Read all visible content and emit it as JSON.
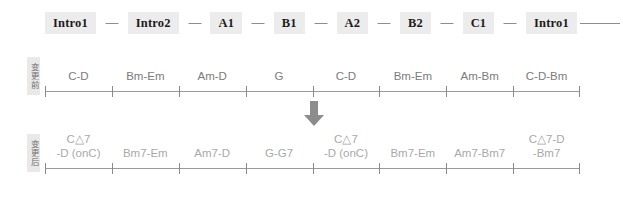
{
  "structure": {
    "sections": [
      "Intro1",
      "Intro2",
      "A1",
      "B1",
      "A2",
      "B2",
      "C1",
      "Intro1"
    ],
    "separator": "—"
  },
  "before": {
    "side_label": "变更前",
    "cells": [
      {
        "line1": "C-D",
        "line2": ""
      },
      {
        "line1": "Bm-Em",
        "line2": ""
      },
      {
        "line1": "Am-D",
        "line2": ""
      },
      {
        "line1": "G",
        "line2": ""
      },
      {
        "line1": "C-D",
        "line2": ""
      },
      {
        "line1": "Bm-Em",
        "line2": ""
      },
      {
        "line1": "Am-Bm",
        "line2": ""
      },
      {
        "line1": "C-D-Bm",
        "line2": ""
      }
    ]
  },
  "after": {
    "side_label": "变更后",
    "cells": [
      {
        "line1": "C△7",
        "line2": "-D (onC)"
      },
      {
        "line1": "Bm7-Em",
        "line2": ""
      },
      {
        "line1": "Am7-D",
        "line2": ""
      },
      {
        "line1": "G-G7",
        "line2": ""
      },
      {
        "line1": "C△7",
        "line2": "-D (onC)"
      },
      {
        "line1": "Bm7-Em",
        "line2": ""
      },
      {
        "line1": "Am7-Bm7",
        "line2": ""
      },
      {
        "line1": "C△7-D",
        "line2": "-Bm7"
      }
    ]
  },
  "arrow": {
    "direction": "down",
    "color": "#8c8c8c"
  },
  "colors": {
    "chip_bg": "#ececed",
    "chip_text": "#1c1c1c",
    "axis": "#9a9a9a",
    "before_text": "#7b7b7b",
    "after_text": "#a9a9a9",
    "side_label_bg": "#e9e9ea"
  }
}
